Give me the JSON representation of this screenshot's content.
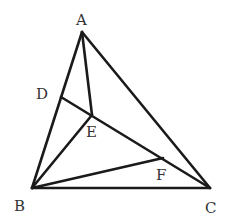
{
  "diagram": {
    "type": "geometry",
    "points": {
      "A": {
        "label": "A",
        "x": 82,
        "y": 32,
        "lx": 76,
        "ly": 25
      },
      "B": {
        "label": "B",
        "x": 32,
        "y": 188,
        "lx": 14,
        "ly": 211
      },
      "C": {
        "label": "C",
        "x": 210,
        "y": 188,
        "lx": 205,
        "ly": 213
      },
      "D": {
        "label": "D",
        "x": 61,
        "y": 97,
        "lx": 36,
        "ly": 99
      },
      "E": {
        "label": "E",
        "x": 92,
        "y": 115,
        "lx": 86,
        "ly": 137
      },
      "F": {
        "label": "F",
        "x": 163,
        "y": 158,
        "lx": 156,
        "ly": 180
      }
    },
    "segments": [
      [
        "A",
        "B"
      ],
      [
        "A",
        "C"
      ],
      [
        "B",
        "C"
      ],
      [
        "A",
        "E"
      ],
      [
        "B",
        "E"
      ],
      [
        "D",
        "C"
      ],
      [
        "B",
        "F"
      ]
    ],
    "stroke_color": "#1a1a1a",
    "label_color": "#333333"
  }
}
